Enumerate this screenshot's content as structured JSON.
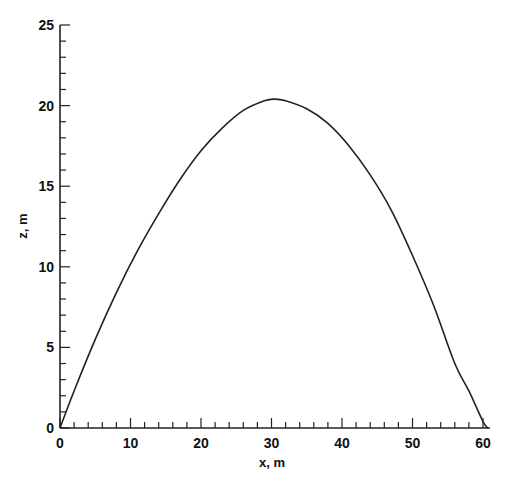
{
  "chart_data": {
    "type": "line",
    "title": "",
    "xlabel": "x, m",
    "ylabel": "z, m",
    "xlim": [
      0,
      61
    ],
    "ylim": [
      0,
      25
    ],
    "x_major_ticks": [
      0,
      10,
      20,
      30,
      40,
      50,
      60
    ],
    "x_minor_step": 2,
    "y_major_ticks": [
      0,
      5,
      10,
      15,
      20,
      25
    ],
    "y_minor_step": 1,
    "grid": false,
    "legend": null,
    "series": [
      {
        "name": "trajectory",
        "color": "#222222",
        "x": [
          0,
          2,
          5,
          8,
          11,
          14,
          17,
          20,
          23,
          26,
          29,
          30.5,
          32,
          35,
          38,
          41,
          44,
          47,
          50,
          53,
          56,
          58,
          60,
          60.7
        ],
        "z": [
          0,
          2.3,
          5.5,
          8.4,
          11.0,
          13.3,
          15.4,
          17.2,
          18.6,
          19.7,
          20.3,
          20.4,
          20.3,
          19.8,
          18.9,
          17.5,
          15.7,
          13.5,
          10.7,
          7.6,
          4.0,
          2.3,
          0.4,
          0
        ]
      }
    ]
  }
}
